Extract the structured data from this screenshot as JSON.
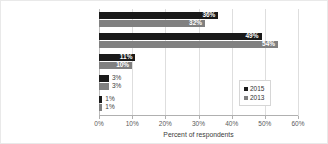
{
  "chart_data": {
    "type": "bar",
    "orientation": "horizontal",
    "title": "",
    "xlabel": "Percent of respondents",
    "ylabel": "",
    "xlim": [
      0,
      60
    ],
    "xtick_labels": [
      "0%",
      "10%",
      "20%",
      "30%",
      "40%",
      "50%",
      "60%"
    ],
    "xticks": [
      0,
      10,
      20,
      30,
      40,
      50,
      60
    ],
    "grid": true,
    "legend_position": "center-right",
    "categories": [
      "Increased significantly",
      "Increased slightly",
      "Value is the same",
      "Decreased slightly",
      "Decreased significantly"
    ],
    "series": [
      {
        "name": "2015",
        "color": "#1a1a1a",
        "values": [
          36,
          49,
          11,
          3,
          1
        ],
        "labels": [
          "36%",
          "49%",
          "11%",
          "3%",
          "1%"
        ]
      },
      {
        "name": "2013",
        "color": "#808080",
        "values": [
          32,
          54,
          10,
          3,
          1
        ],
        "labels": [
          "32%",
          "54%",
          "10%",
          "3%",
          "1%"
        ]
      }
    ]
  }
}
